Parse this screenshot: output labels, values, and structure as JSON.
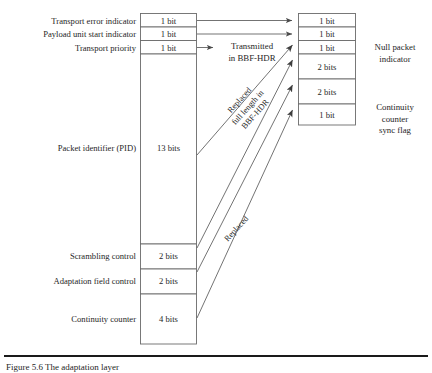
{
  "figure": {
    "caption": "Figure 5.6  The adaptation layer",
    "left_column": {
      "title": "MPEG-TS packet header fields",
      "rows": [
        {
          "label": "Transport error indicator",
          "size": "1 bit"
        },
        {
          "label": "Payload unit start indicator",
          "size": "1 bit"
        },
        {
          "label": "Transport priority",
          "size": "1 bit"
        },
        {
          "label": "Packet identifier (PID)",
          "size": "13 bits"
        },
        {
          "label": "Scrambling control",
          "size": "2 bits"
        },
        {
          "label": "Adaptation field control",
          "size": "2 bits"
        },
        {
          "label": "Continuity counter",
          "size": "4 bits"
        }
      ]
    },
    "right_column": {
      "rows": [
        {
          "size": "1 bit"
        },
        {
          "size": "1 bit"
        },
        {
          "size": "1 bit"
        },
        {
          "size": "2 bits"
        },
        {
          "size": "2 bits"
        },
        {
          "size": "1 bit"
        }
      ],
      "annotations": [
        {
          "text": "Null packet\nindicator"
        },
        {
          "text": "Continuity\ncounter\nsync flag"
        }
      ],
      "null_packet_indicator_line1": "Null packet",
      "null_packet_indicator_line2": "indicator",
      "continuity_sync_line1": "Continuity",
      "continuity_sync_line2": "counter",
      "continuity_sync_line3": "sync flag"
    },
    "connector_labels": {
      "transmitted_line1": "Transmitted",
      "transmitted_line2": "in BBF-HDR",
      "replaced_full_line1": "Replaced",
      "replaced_full_line2": "full length in",
      "replaced_full_line3": "BBF-HDR",
      "replaced": "Replaced"
    },
    "colors": {
      "box_stroke": "#6b6b6b",
      "arrow": "#5a5a5a",
      "text": "#262626",
      "rule": "#1a1a1a",
      "background": "#ffffff"
    }
  }
}
